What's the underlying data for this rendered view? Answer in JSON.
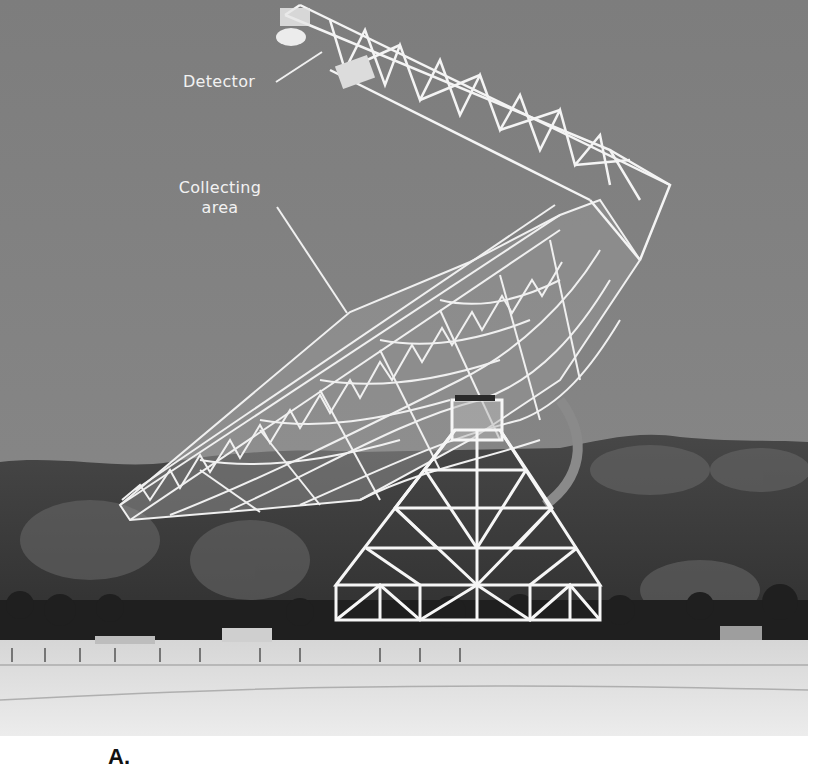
{
  "figure": {
    "caption_letter": "A.",
    "annotations": [
      {
        "id": "detector",
        "text": "Detector",
        "leader_from": [
          276,
          82
        ],
        "leader_to": [
          322,
          50
        ]
      },
      {
        "id": "collecting",
        "text_line1": "Collecting",
        "text_line2": "area",
        "leader_from": [
          277,
          207
        ],
        "leader_to": [
          347,
          313
        ]
      }
    ],
    "colors": {
      "sky": "#7b7b7b",
      "hills": "#3e3e3e",
      "snow_ground": "#e4e4e4",
      "structure": "#f4f4f4",
      "label_text": "#f2f2f2",
      "page_bg": "#ffffff"
    }
  }
}
